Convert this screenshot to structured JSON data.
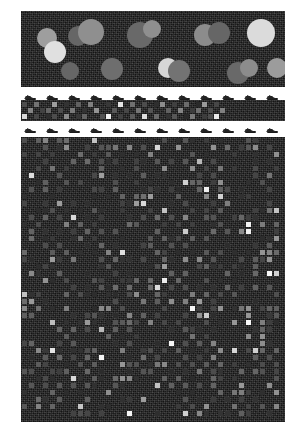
{
  "figure": {
    "title": "",
    "background_color": "#ffffff",
    "panel_background": "#141414",
    "width": 298,
    "height": 439
  },
  "panels": [
    {
      "id": "panel-a",
      "name": "circles-field",
      "x": 21,
      "y": 11,
      "width": 264,
      "height": 76,
      "description": "noisy dark field with overlapping gray disks"
    },
    {
      "id": "panel-b",
      "name": "thin-checker-strip",
      "x": 21,
      "y": 100,
      "width": 264,
      "height": 21,
      "description": "single-band checkerboard strip flanked by arrow markers"
    },
    {
      "id": "panel-c",
      "name": "large-checker-grid",
      "x": 21,
      "y": 137,
      "width": 264,
      "height": 285,
      "description": "large checkerboard grid of variable-brightness squares"
    }
  ],
  "chart_data": {
    "type": "heatmap",
    "title": "",
    "xlabel": "",
    "ylabel": "",
    "colormap": "gray",
    "value_range": [
      0,
      1
    ],
    "panel_a": {
      "type": "scatter",
      "background": "#141414",
      "marker_shape": "circle",
      "circles": [
        {
          "cx": 26,
          "cy": 27,
          "r": 10,
          "gray": 0.62
        },
        {
          "cx": 34,
          "cy": 41,
          "r": 11,
          "gray": 0.88
        },
        {
          "cx": 57,
          "cy": 25,
          "r": 10,
          "gray": 0.4
        },
        {
          "cx": 70,
          "cy": 21,
          "r": 13,
          "gray": 0.56
        },
        {
          "cx": 49,
          "cy": 60,
          "r": 9,
          "gray": 0.4
        },
        {
          "cx": 91,
          "cy": 58,
          "r": 11,
          "gray": 0.43
        },
        {
          "cx": 119,
          "cy": 24,
          "r": 13,
          "gray": 0.41
        },
        {
          "cx": 131,
          "cy": 18,
          "r": 9,
          "gray": 0.56
        },
        {
          "cx": 147,
          "cy": 57,
          "r": 10,
          "gray": 0.84
        },
        {
          "cx": 158,
          "cy": 60,
          "r": 11,
          "gray": 0.45
        },
        {
          "cx": 184,
          "cy": 24,
          "r": 11,
          "gray": 0.55
        },
        {
          "cx": 198,
          "cy": 22,
          "r": 11,
          "gray": 0.4
        },
        {
          "cx": 217,
          "cy": 62,
          "r": 11,
          "gray": 0.41
        },
        {
          "cx": 228,
          "cy": 57,
          "r": 9,
          "gray": 0.55
        },
        {
          "cx": 240,
          "cy": 22,
          "r": 14,
          "gray": 0.86
        },
        {
          "cx": 256,
          "cy": 57,
          "r": 10,
          "gray": 0.61
        }
      ]
    },
    "panel_b": {
      "type": "heatmap",
      "rows": 3,
      "cols": 34,
      "cell_size": 6,
      "values": [
        [
          0.3,
          0.1,
          0.45,
          0.08,
          0.12,
          0.62,
          0.09,
          0.2,
          0.1,
          0.38,
          0.11,
          0.5,
          0.09,
          0.13,
          0.22,
          0.1,
          0.9,
          0.12,
          0.44,
          0.08,
          0.3,
          0.11,
          0.18,
          0.55,
          0.1,
          0.25,
          0.09,
          0.42,
          0.12,
          0.16,
          0.6,
          0.1,
          0.28,
          0.11
        ],
        [
          0.1,
          0.52,
          0.11,
          0.26,
          0.4,
          0.09,
          0.3,
          0.12,
          0.48,
          0.1,
          0.2,
          0.1,
          0.58,
          0.11,
          0.09,
          0.35,
          0.12,
          0.28,
          0.1,
          0.46,
          0.11,
          0.33,
          0.09,
          0.14,
          0.38,
          0.1,
          0.52,
          0.11,
          0.24,
          0.44,
          0.1,
          0.3,
          0.12,
          0.5
        ],
        [
          0.85,
          0.12,
          0.28,
          0.1,
          0.18,
          0.3,
          0.12,
          0.55,
          0.1,
          0.22,
          0.4,
          0.09,
          0.14,
          0.32,
          0.95,
          0.11,
          0.26,
          0.09,
          0.36,
          0.12,
          0.88,
          0.1,
          0.42,
          0.11,
          0.2,
          0.34,
          0.12,
          0.16,
          0.48,
          0.09,
          0.24,
          0.3,
          0.92,
          0.11
        ]
      ],
      "arrow_markers_top": 12,
      "arrow_markers_bottom": 12
    },
    "panel_c": {
      "type": "heatmap",
      "rows": 40,
      "cols": 37,
      "cell_size": 7,
      "note": "procedurally generated checkerboard of grayscale squares; bright cells sparse, most cells near background level"
    }
  },
  "markers": {
    "name": "arrow-marker",
    "color": "#222222",
    "top_row_y": 91,
    "bottom_row_y": 124,
    "count_per_row": 12
  }
}
